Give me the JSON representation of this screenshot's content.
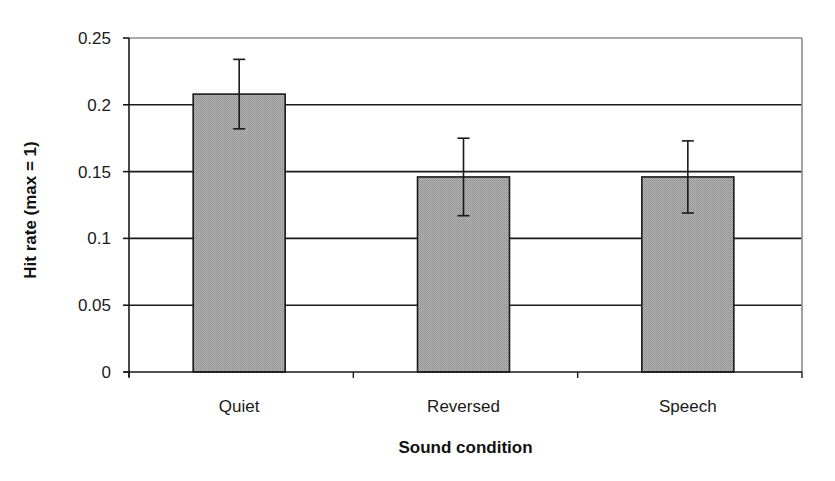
{
  "chart_data": {
    "type": "bar",
    "title": "",
    "xlabel": "Sound condition",
    "ylabel": "Hit rate (max = 1)",
    "categories": [
      "Quiet",
      "Reversed",
      "Speech"
    ],
    "values": [
      0.208,
      0.146,
      0.146
    ],
    "error": [
      0.026,
      0.029,
      0.027
    ],
    "ylim": [
      0,
      0.25
    ],
    "yticks": [
      0,
      0.05,
      0.1,
      0.15,
      0.2,
      0.25
    ],
    "ytick_labels": [
      "0",
      "0.05",
      "0.1",
      "0.15",
      "0.2",
      "0.25"
    ],
    "grid": true,
    "legend": "none",
    "colors": {
      "bar_fill": "#a9a9a9",
      "bar_edge": "#1a1a1a",
      "gridline": "#1a1a1a",
      "plot_border": "#8c8c8c",
      "error_bar": "#1a1a1a"
    }
  }
}
